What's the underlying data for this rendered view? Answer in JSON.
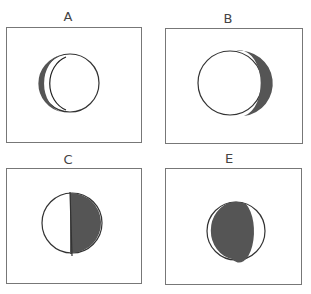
{
  "panels": [
    {
      "label": "A",
      "phase": "waxing-crescent-left",
      "shaded_side": "left",
      "shading": "thin crescent"
    },
    {
      "label": "B",
      "phase": "crescent-right",
      "shaded_side": "right",
      "shading": "thin crescent"
    },
    {
      "label": "C",
      "phase": "half-shaded-right",
      "shaded_side": "right",
      "shading": "half"
    },
    {
      "label": "E",
      "phase": "gibbous-shaded-left",
      "shaded_side": "left",
      "shading": "mostly shaded"
    }
  ],
  "colors": {
    "stroke": "#333333",
    "shade": "#555555",
    "border": "#777777"
  }
}
